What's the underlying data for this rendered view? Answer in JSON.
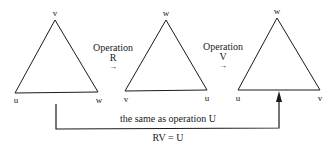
{
  "diagram": {
    "triangles": [
      {
        "id": "initial",
        "vertices": {
          "top": "v",
          "bottom_left": "u",
          "bottom_right": "w"
        }
      },
      {
        "id": "after-R",
        "vertices": {
          "top": "w",
          "bottom_left": "v",
          "bottom_right": "u"
        }
      },
      {
        "id": "after-V",
        "vertices": {
          "top": "w",
          "bottom_left": "u",
          "bottom_right": "v"
        }
      }
    ],
    "operations": [
      {
        "word": "Operation",
        "name": "R",
        "arrow": "→"
      },
      {
        "word": "Operation",
        "name": "V",
        "arrow": "→"
      }
    ],
    "composite": {
      "description": "the same as operation U",
      "equation": "RV = U"
    },
    "colors": {
      "stroke": "#1a1a1a",
      "background": "#ffffff"
    }
  }
}
